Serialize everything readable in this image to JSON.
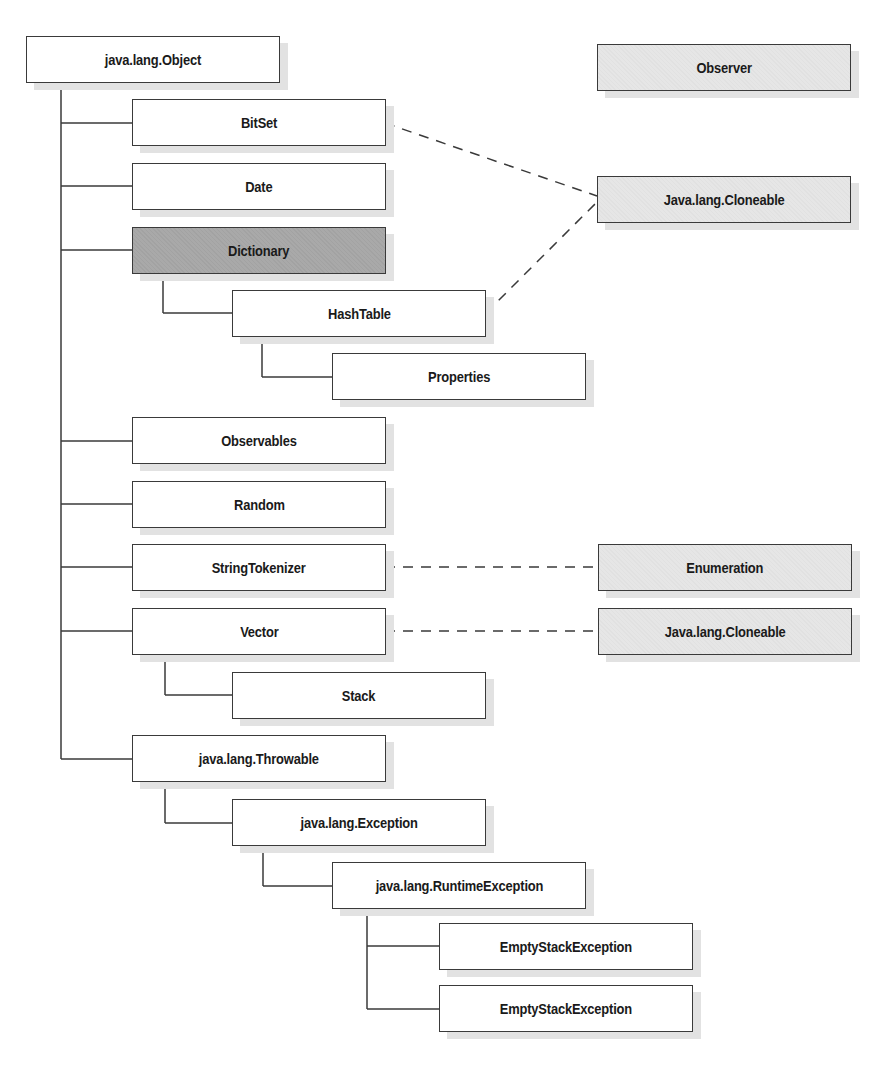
{
  "diagram": {
    "type": "class-hierarchy",
    "colors": {
      "class_fill": "#ffffff",
      "abstract_fill": "#a9a9a9",
      "interface_fill": "#e6e6e6",
      "border": "#3a3a3a",
      "shadow": "#e2e2e2",
      "line": "#3a3a3a"
    },
    "classes": {
      "object": {
        "label": "java.lang.Object",
        "kind": "class"
      },
      "bitset": {
        "label": "BitSet",
        "kind": "class",
        "parent": "java.lang.Object"
      },
      "date": {
        "label": "Date",
        "kind": "class",
        "parent": "java.lang.Object"
      },
      "dictionary": {
        "label": "Dictionary",
        "kind": "abstract",
        "parent": "java.lang.Object"
      },
      "hashtable": {
        "label": "HashTable",
        "kind": "class",
        "parent": "Dictionary"
      },
      "properties": {
        "label": "Properties",
        "kind": "class",
        "parent": "HashTable"
      },
      "observables": {
        "label": "Observables",
        "kind": "class",
        "parent": "java.lang.Object"
      },
      "random": {
        "label": "Random",
        "kind": "class",
        "parent": "java.lang.Object"
      },
      "stringtokenizer": {
        "label": "StringTokenizer",
        "kind": "class",
        "parent": "java.lang.Object"
      },
      "vector": {
        "label": "Vector",
        "kind": "class",
        "parent": "java.lang.Object"
      },
      "stack": {
        "label": "Stack",
        "kind": "class",
        "parent": "Vector"
      },
      "throwable": {
        "label": "java.lang.Throwable",
        "kind": "class",
        "parent": "java.lang.Object"
      },
      "exception": {
        "label": "java.lang.Exception",
        "kind": "class",
        "parent": "java.lang.Throwable"
      },
      "runtimeexception": {
        "label": "java.lang.RuntimeException",
        "kind": "class",
        "parent": "java.lang.Exception"
      },
      "emptystack1": {
        "label": "EmptyStackException",
        "kind": "class",
        "parent": "java.lang.RuntimeException"
      },
      "emptystack2": {
        "label": "EmptyStackException",
        "kind": "class",
        "parent": "java.lang.RuntimeException"
      }
    },
    "interfaces": {
      "observer": {
        "label": "Observer",
        "kind": "interface"
      },
      "cloneable1": {
        "label": "Java.lang.Cloneable",
        "kind": "interface"
      },
      "enumeration": {
        "label": "Enumeration",
        "kind": "interface"
      },
      "cloneable2": {
        "label": "Java.lang.Cloneable",
        "kind": "interface"
      }
    },
    "implements": [
      {
        "from": "BitSet",
        "to": "Java.lang.Cloneable"
      },
      {
        "from": "HashTable",
        "to": "Java.lang.Cloneable"
      },
      {
        "from": "StringTokenizer",
        "to": "Enumeration"
      },
      {
        "from": "Vector",
        "to": "Java.lang.Cloneable"
      }
    ]
  }
}
